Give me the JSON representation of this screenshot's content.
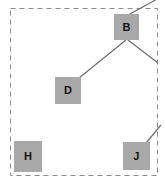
{
  "figure": {
    "title": "",
    "background_color": "#ffffff",
    "canvas": {
      "width": 165,
      "height": 185
    }
  },
  "boundary": {
    "name": "dashed-clipping-frame",
    "style": "dashed",
    "color": "#8c8c8c",
    "x": 10,
    "y": 8,
    "width": 147,
    "height": 167
  },
  "graph": {
    "type": "tree-fragment",
    "node_fill": "#a9a9a9",
    "node_text_color": "#111111",
    "edge_color": "#6e6e6e",
    "edge_width": 1.2,
    "nodes": [
      {
        "id": "B",
        "label": "B",
        "x": 114,
        "y": 14,
        "width": 25,
        "height": 26
      },
      {
        "id": "D",
        "label": "D",
        "x": 55,
        "y": 77,
        "width": 26,
        "height": 27
      },
      {
        "id": "H",
        "label": "H",
        "x": 14,
        "y": 141,
        "width": 28,
        "height": 31
      },
      {
        "id": "J",
        "label": "J",
        "x": 123,
        "y": 142,
        "width": 27,
        "height": 28
      }
    ],
    "edges": [
      {
        "name": "edge-b-up-right",
        "from": "B",
        "to": "offscreen-parent",
        "x1": 128,
        "y1": 15,
        "x2": 160,
        "y2": -2
      },
      {
        "name": "edge-b-to-d",
        "from": "B",
        "to": "D",
        "x1": 126,
        "y1": 40,
        "x2": 79,
        "y2": 78
      },
      {
        "name": "edge-b-down-right",
        "from": "B",
        "to": "offscreen-right",
        "x1": 128,
        "y1": 40,
        "x2": 158,
        "y2": 63
      },
      {
        "name": "edge-j-up-right",
        "from": "J",
        "to": "offscreen-right",
        "x1": 146,
        "y1": 143,
        "x2": 160,
        "y2": 126
      }
    ]
  }
}
